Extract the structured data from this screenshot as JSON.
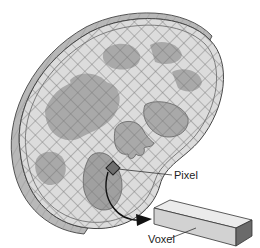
{
  "diagram": {
    "type": "ct-slice-pixel-voxel",
    "labels": {
      "pixel": "Pixel",
      "voxel": "Voxel"
    },
    "colors": {
      "background": "#ffffff",
      "slice_fill": "#d9d9d9",
      "slice_edge": "#9a9a9a",
      "grid_line": "#7a7a7a",
      "organ_fill": "#a8a8a8",
      "pixel_fill": "#6e6e6e",
      "voxel_top": "#e6e6e6",
      "voxel_front": "#cfcfcf",
      "voxel_end": "#6a6a6a",
      "outline": "#333333"
    },
    "elements": [
      {
        "name": "slice",
        "description": "Thick kidney-shaped CT slice overlaid with a diagonal pixel grid"
      },
      {
        "name": "organs",
        "description": "Darker gray blob regions representing anatomical structures"
      },
      {
        "name": "pixel",
        "description": "Single highlighted dark square in the grid"
      },
      {
        "name": "arrow",
        "description": "Curved arrow from the pixel to the voxel"
      },
      {
        "name": "voxel",
        "description": "Elongated rectangular prism showing the pixel's depth"
      }
    ]
  }
}
